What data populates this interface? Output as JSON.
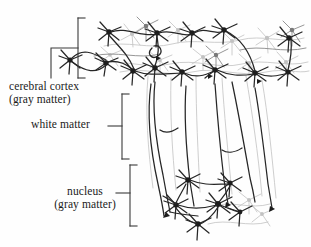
{
  "figure": {
    "background_color": "#fefefe",
    "ink_color": "#1b1b1b",
    "faint_ink_color": "#b9b9b9",
    "mid_ink_color": "#6f6f6f"
  },
  "labels": {
    "cortex": {
      "line1": "cerebral cortex",
      "line2": "(gray matter)"
    },
    "white_matter": {
      "line1": "white matter"
    },
    "nucleus": {
      "line1": "nucleus",
      "line2": "(gray matter)"
    }
  },
  "brackets": [
    {
      "name": "cortex-bracket",
      "x": 78,
      "top": 18,
      "bottom": 78,
      "tick": 7
    },
    {
      "name": "white-matter-bracket",
      "x": 122,
      "top": 94,
      "bottom": 159,
      "tick": 7
    },
    {
      "name": "nucleus-bracket",
      "x": 130,
      "top": 165,
      "bottom": 226,
      "tick": 7
    }
  ],
  "regions": [
    {
      "name": "cerebral-cortex",
      "description": "band of star-shaped neurons across the top"
    },
    {
      "name": "white-matter",
      "description": "long descending axon fibers converging inward"
    },
    {
      "name": "nucleus",
      "description": "cluster of neurons where fibers terminate"
    }
  ]
}
